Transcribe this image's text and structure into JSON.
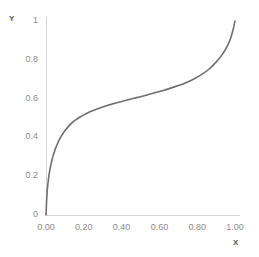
{
  "chart_data": {
    "type": "line",
    "title": "",
    "xlabel": "X",
    "ylabel": "Y",
    "xlim": [
      0.0,
      1.0
    ],
    "ylim": [
      0.0,
      1.0
    ],
    "grid": false,
    "legend": null,
    "line_color": "#6e6e6e",
    "axis_color": "#d4d4d4",
    "x_tick_labels": [
      "0.00",
      "0.20",
      "0.40",
      "0.60",
      "0.80",
      "1.00"
    ],
    "x_ticks": [
      0.0,
      0.2,
      0.4,
      0.6,
      0.8,
      1.0
    ],
    "y_tick_labels": [
      "1",
      "0.8",
      "0.6",
      "0.4",
      "0.2",
      "0"
    ],
    "y_ticks": [
      1.0,
      0.8,
      0.6,
      0.4,
      0.2,
      0.0
    ],
    "series": [
      {
        "name": "curve",
        "x": [
          0.0,
          0.005,
          0.01,
          0.015,
          0.02,
          0.03,
          0.04,
          0.05,
          0.06,
          0.07,
          0.08,
          0.09,
          0.1,
          0.12,
          0.14,
          0.16,
          0.18,
          0.2,
          0.23,
          0.26,
          0.3,
          0.34,
          0.38,
          0.42,
          0.46,
          0.5,
          0.54,
          0.58,
          0.62,
          0.66,
          0.7,
          0.74,
          0.78,
          0.82,
          0.86,
          0.9,
          0.93,
          0.955,
          0.975,
          0.99,
          1.0
        ],
        "y": [
          0.0,
          0.105,
          0.16,
          0.2,
          0.23,
          0.278,
          0.313,
          0.342,
          0.366,
          0.387,
          0.405,
          0.42,
          0.434,
          0.458,
          0.477,
          0.492,
          0.505,
          0.516,
          0.531,
          0.543,
          0.557,
          0.569,
          0.58,
          0.59,
          0.6,
          0.61,
          0.62,
          0.631,
          0.642,
          0.654,
          0.667,
          0.682,
          0.7,
          0.722,
          0.75,
          0.788,
          0.824,
          0.863,
          0.906,
          0.955,
          1.0
        ]
      }
    ]
  },
  "axes": {
    "y_title": "Y",
    "x_title": "X"
  }
}
